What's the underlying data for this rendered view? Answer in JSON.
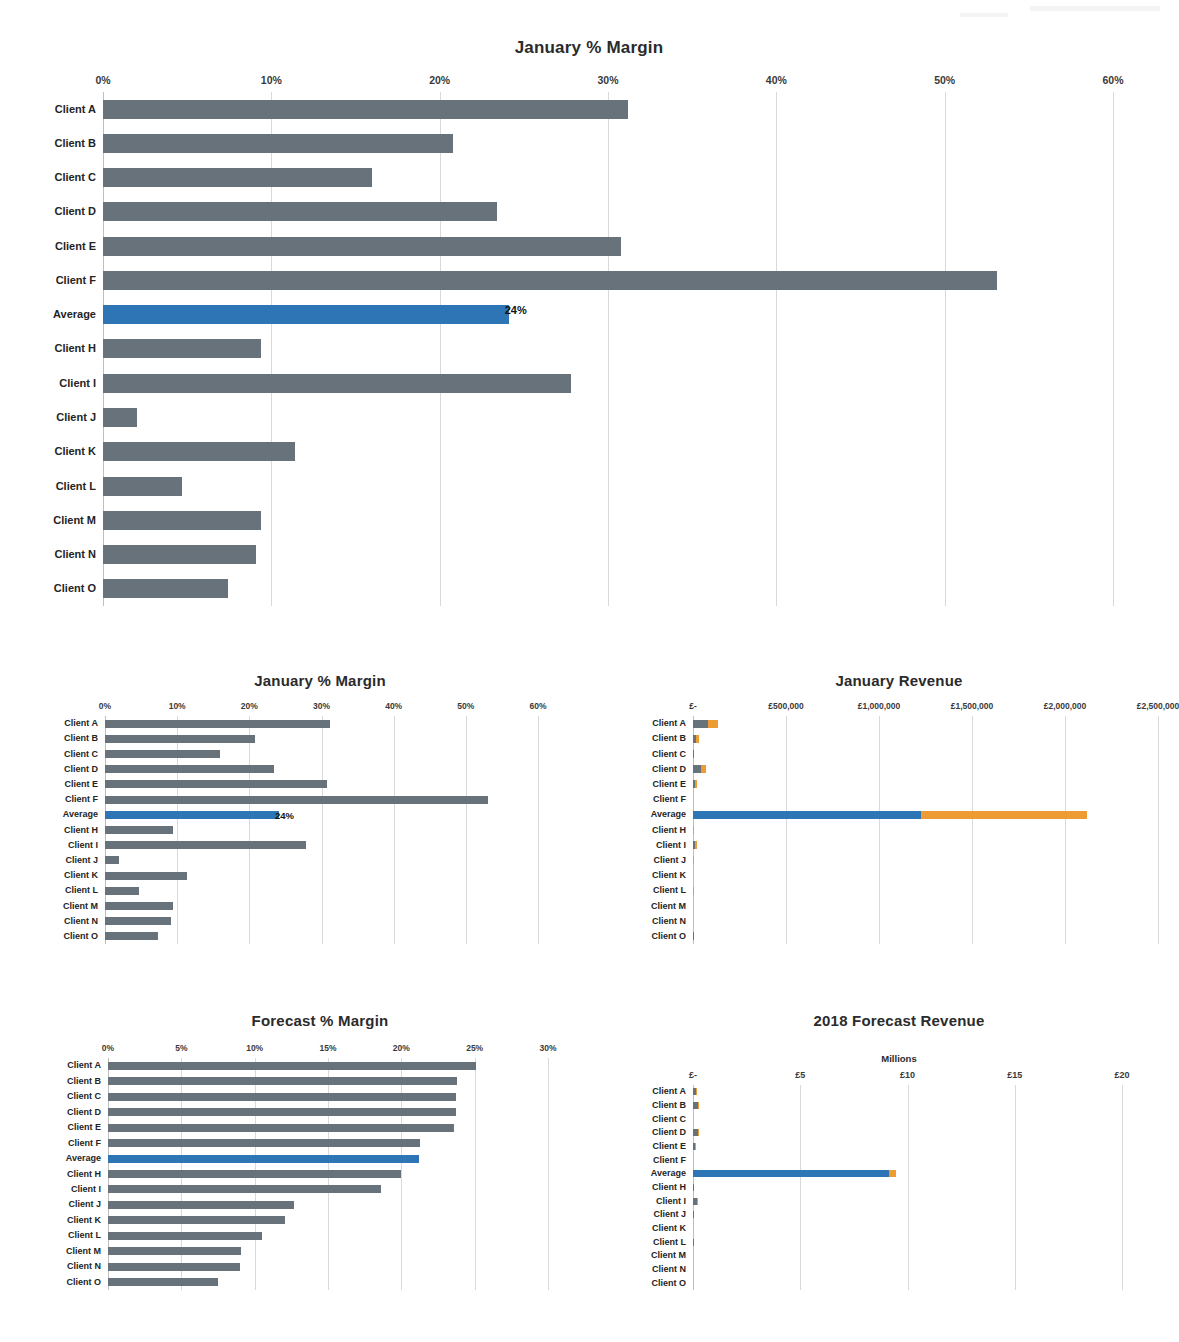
{
  "colors": {
    "bar_grey": "#67727a",
    "bar_blue": "#2e75b6",
    "bar_orange": "#ed9b33",
    "gridline": "#d9d9d9",
    "text": "#242424"
  },
  "categories": [
    "Client A",
    "Client B",
    "Client C",
    "Client D",
    "Client E",
    "Client F",
    "Average",
    "Client H",
    "Client I",
    "Client J",
    "Client K",
    "Client L",
    "Client M",
    "Client N",
    "Client O"
  ],
  "chart_data": [
    {
      "id": "main-january-margin",
      "type": "bar",
      "orientation": "horizontal",
      "title": "January % Margin",
      "xlabel": "",
      "ylabel": "",
      "xlim": [
        0,
        60
      ],
      "xticks": [
        0,
        10,
        20,
        30,
        40,
        50,
        60
      ],
      "xticklabels": [
        "0%",
        "10%",
        "20%",
        "30%",
        "40%",
        "50%",
        "60%"
      ],
      "grid": true,
      "legend": "none",
      "categories": [
        "Client A",
        "Client B",
        "Client C",
        "Client D",
        "Client E",
        "Client F",
        "Average",
        "Client H",
        "Client I",
        "Client J",
        "Client K",
        "Client L",
        "Client M",
        "Client N",
        "Client O"
      ],
      "values": [
        31.2,
        20.8,
        16.0,
        23.4,
        30.8,
        53.1,
        24.1,
        9.4,
        27.8,
        2.0,
        11.4,
        4.7,
        9.4,
        9.1,
        7.4
      ],
      "highlight_index": 6,
      "data_labels": {
        "6": "24%"
      }
    },
    {
      "id": "january-margin-small",
      "type": "bar",
      "orientation": "horizontal",
      "title": "January % Margin",
      "xlabel": "",
      "ylabel": "",
      "xlim": [
        0,
        60
      ],
      "xticks": [
        0,
        10,
        20,
        30,
        40,
        50,
        60
      ],
      "xticklabels": [
        "0%",
        "10%",
        "20%",
        "30%",
        "40%",
        "50%",
        "60%"
      ],
      "grid": true,
      "legend": "none",
      "categories": [
        "Client A",
        "Client B",
        "Client C",
        "Client D",
        "Client E",
        "Client F",
        "Average",
        "Client H",
        "Client I",
        "Client J",
        "Client K",
        "Client L",
        "Client M",
        "Client N",
        "Client O"
      ],
      "values": [
        31.2,
        20.8,
        16.0,
        23.4,
        30.8,
        53.1,
        24.1,
        9.4,
        27.8,
        2.0,
        11.4,
        4.7,
        9.4,
        9.1,
        7.4
      ],
      "highlight_index": 6,
      "data_labels": {
        "6": "24%"
      }
    },
    {
      "id": "january-revenue",
      "type": "bar",
      "orientation": "horizontal",
      "stacked": true,
      "title": "January Revenue",
      "xlabel": "",
      "ylabel": "",
      "xlim": [
        0,
        2500000
      ],
      "xticks": [
        0,
        500000,
        1000000,
        1500000,
        2000000,
        2500000
      ],
      "xticklabels": [
        "£-",
        "£500,000",
        "£1,000,000",
        "£1,500,000",
        "£2,000,000",
        "£2,500,000"
      ],
      "grid": true,
      "legend": "none",
      "categories": [
        "Client A",
        "Client B",
        "Client C",
        "Client D",
        "Client E",
        "Client F",
        "Average",
        "Client H",
        "Client I",
        "Client J",
        "Client K",
        "Client L",
        "Client M",
        "Client N",
        "Client O"
      ],
      "series": [
        {
          "name": "Cost",
          "color": "#67727a",
          "values": [
            340000,
            150000,
            30000,
            250000,
            145000,
            10000,
            1330000,
            40000,
            135000,
            25000,
            14000,
            38000,
            8000,
            10000,
            26000
          ]
        },
        {
          "name": "Margin",
          "color": "#ed9b33",
          "values": [
            240000,
            130000,
            8000,
            165000,
            85000,
            3000,
            970000,
            22000,
            95000,
            38000,
            5000,
            25000,
            5000,
            6000,
            18000
          ]
        }
      ],
      "highlight_index": 6,
      "highlight_color": "#2e75b6"
    },
    {
      "id": "forecast-margin",
      "type": "bar",
      "orientation": "horizontal",
      "title": "Forecast % Margin",
      "xlabel": "",
      "ylabel": "",
      "xlim": [
        0,
        30
      ],
      "xticks": [
        0,
        5,
        10,
        15,
        20,
        25,
        30
      ],
      "xticklabels": [
        "0%",
        "5%",
        "10%",
        "15%",
        "20%",
        "25%",
        "30%"
      ],
      "grid": true,
      "legend": "none",
      "categories": [
        "Client A",
        "Client B",
        "Client C",
        "Client D",
        "Client E",
        "Client F",
        "Average",
        "Client H",
        "Client I",
        "Client J",
        "Client K",
        "Client L",
        "Client M",
        "Client N",
        "Client O"
      ],
      "values": [
        25.1,
        23.8,
        23.7,
        23.7,
        23.6,
        21.3,
        21.2,
        20.0,
        18.6,
        12.7,
        12.1,
        10.5,
        9.1,
        9.0,
        7.5
      ],
      "highlight_index": 6
    },
    {
      "id": "forecast-revenue-2018",
      "type": "bar",
      "orientation": "horizontal",
      "stacked": true,
      "title": "2018 Forecast Revenue",
      "axis_unit_label": "Millions",
      "xlabel": "",
      "ylabel": "",
      "xlim": [
        0,
        20
      ],
      "xticks": [
        0,
        5,
        10,
        15,
        20
      ],
      "xticklabels": [
        "£-",
        "£5",
        "£10",
        "£15",
        "£20"
      ],
      "grid": true,
      "legend": "none",
      "categories": [
        "Client A",
        "Client B",
        "Client C",
        "Client D",
        "Client E",
        "Client F",
        "Average",
        "Client H",
        "Client I",
        "Client J",
        "Client K",
        "Client L",
        "Client M",
        "Client N",
        "Client O"
      ],
      "series": [
        {
          "name": "Cost",
          "color": "#67727a",
          "values": [
            1.45,
            2.1,
            0.08,
            1.95,
            1.5,
            0.06,
            13.3,
            0.3,
            1.85,
            0.42,
            0.12,
            0.38,
            0.13,
            0.12,
            0.25
          ]
        },
        {
          "name": "Margin",
          "color": "#ed9b33",
          "values": [
            0.3,
            0.22,
            0.02,
            0.22,
            0.03,
            0.01,
            0.45,
            0.04,
            0.25,
            0.03,
            0.02,
            0.03,
            0.02,
            0.02,
            0.03
          ]
        }
      ],
      "highlight_index": 6,
      "highlight_color": "#2e75b6"
    }
  ]
}
